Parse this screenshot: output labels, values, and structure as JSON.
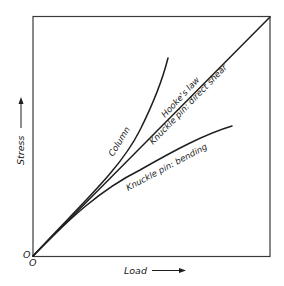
{
  "diagram": {
    "axes": {
      "x_label": "Load",
      "y_label": "Stress",
      "origin_x_label": "O",
      "origin_y_label": "O"
    },
    "curves": [
      {
        "id": "column",
        "label": "Column",
        "shape": "concave-up, rising above linear"
      },
      {
        "id": "hookes-law",
        "label": "Hooke's law",
        "shape": "straight line"
      },
      {
        "id": "knuckle-pin-direct-shear",
        "label": "Knuckle pin: direct shear",
        "shape": "straight line (same as Hooke's law)"
      },
      {
        "id": "knuckle-pin-bending",
        "label": "Knuckle pin: bending",
        "shape": "concave-down, falling below linear"
      }
    ],
    "colors": {
      "line": "#1e1e1e",
      "frame": "#3a3a3a",
      "background": "#ffffff"
    }
  }
}
